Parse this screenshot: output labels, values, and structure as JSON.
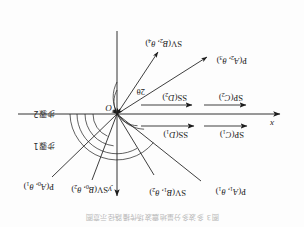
{
  "figure": {
    "caption": "图3 多波多分量地震波场传播路径示意图",
    "type": "vector-angle-diagram",
    "orientation_note": "scan reproduced rotated 180 degrees",
    "origin_label": "O",
    "axes": {
      "x_label": "x",
      "y_label": "y",
      "x_axis_name": "horizontal-axis",
      "y_axis_name": "vertical-axis"
    },
    "angle_labels": [
      {
        "text": "2θ",
        "name": "angle-2theta"
      }
    ],
    "region_labels": [
      {
        "text": "步骤1",
        "name": "region-step-1"
      },
      {
        "text": "步骤2",
        "name": "region-step-2"
      }
    ],
    "ray_labels": [
      {
        "id": "p-a0",
        "text_main": "P(",
        "var1": "A",
        "sub1": "0",
        "sep": ", ",
        "var2": "θ",
        "sub2": "1",
        "close": ")"
      },
      {
        "id": "sv-b0",
        "text_main": "SV(",
        "var1": "B",
        "sub1": "0",
        "sep": ", ",
        "var2": "θ",
        "sub2": "2",
        "close": ")"
      },
      {
        "id": "sv-b1",
        "text_main": "SV(",
        "var1": "B",
        "sub1": "1",
        "sep": ", ",
        "var2": "θ",
        "sub2": "2",
        "close": ")"
      },
      {
        "id": "p-a1",
        "text_main": "P(",
        "var1": "A",
        "sub1": "1",
        "sep": ", ",
        "var2": "θ",
        "sub2": "1",
        "close": ")"
      },
      {
        "id": "p-a2",
        "text_main": "P(",
        "var1": "A",
        "sub1": "2",
        "sep": ", ",
        "var2": "θ",
        "sub2": "3",
        "close": ")"
      },
      {
        "id": "sv-b2",
        "text_main": "SV(",
        "var1": "B",
        "sub1": "2",
        "sep": ", ",
        "var2": "θ",
        "sub2": "4",
        "close": ")"
      }
    ],
    "horizontal_wave_labels": [
      {
        "id": "ss-d1",
        "text_main": "SS(",
        "var1": "D",
        "sub1": "1",
        "close": ")"
      },
      {
        "id": "sp-c1",
        "text_main": "SP(",
        "var1": "C",
        "sub1": "1",
        "close": ")"
      },
      {
        "id": "ss-d2",
        "text_main": "SS(",
        "var1": "D",
        "sub1": "2",
        "close": ")"
      },
      {
        "id": "sp-c2",
        "text_main": "SP(",
        "var1": "C",
        "sub1": "2",
        "close": ")"
      }
    ],
    "colors": {
      "stroke": "#1c1c1c",
      "background": "#fdfdfd",
      "text": "#1a1a1a",
      "caption": "#b9b9b9"
    }
  }
}
